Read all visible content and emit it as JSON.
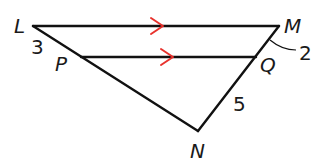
{
  "figure": {
    "points": [
      {
        "name": "L"
      },
      {
        "name": "M"
      },
      {
        "name": "P"
      },
      {
        "name": "Q"
      },
      {
        "name": "N"
      }
    ],
    "segments": [
      "LM",
      "PQ",
      "LN",
      "MN"
    ],
    "parallel": {
      "lines": [
        "LM",
        "PQ"
      ],
      "marker_color": "#e8322d"
    },
    "measures": [
      {
        "segment": "LP",
        "value": "3"
      },
      {
        "segment": "MQ",
        "value": "2"
      },
      {
        "segment": "QN",
        "value": "5"
      }
    ]
  }
}
